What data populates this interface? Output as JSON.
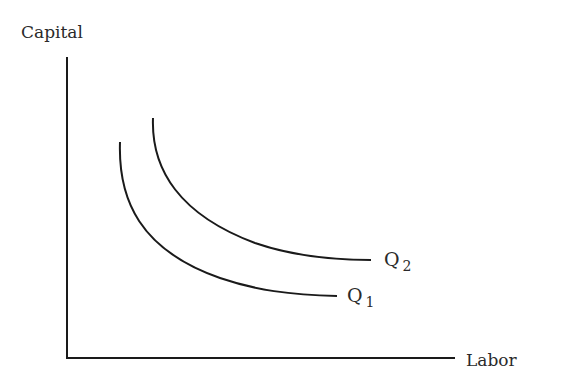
{
  "diagram": {
    "type": "isoquant-map",
    "y_axis_label": "Capital",
    "x_axis_label": "Labor",
    "curves": [
      {
        "name": "Q",
        "subscript": "1"
      },
      {
        "name": "Q",
        "subscript": "2"
      }
    ],
    "stroke_color": "#1a1a1a"
  }
}
